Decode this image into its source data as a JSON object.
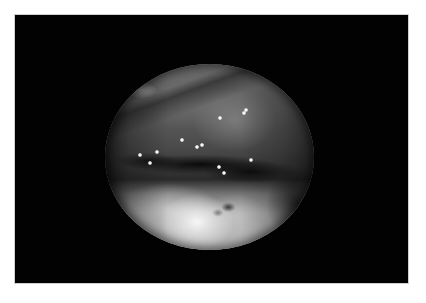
{
  "image": {
    "description": "Endoscopic view within black frame",
    "frame_color": "#020202",
    "background_color": "#ffffff",
    "view_shape": "ellipse",
    "view_center": [
      209,
      157
    ],
    "view_radii": [
      104,
      93
    ]
  },
  "highlights": [
    {
      "x": 182,
      "y": 140
    },
    {
      "x": 197,
      "y": 147
    },
    {
      "x": 202,
      "y": 145
    },
    {
      "x": 140,
      "y": 155
    },
    {
      "x": 150,
      "y": 163
    },
    {
      "x": 157,
      "y": 152
    },
    {
      "x": 219,
      "y": 167
    },
    {
      "x": 251,
      "y": 160
    },
    {
      "x": 224,
      "y": 173
    },
    {
      "x": 220,
      "y": 118
    },
    {
      "x": 244,
      "y": 113
    },
    {
      "x": 246,
      "y": 110
    }
  ]
}
